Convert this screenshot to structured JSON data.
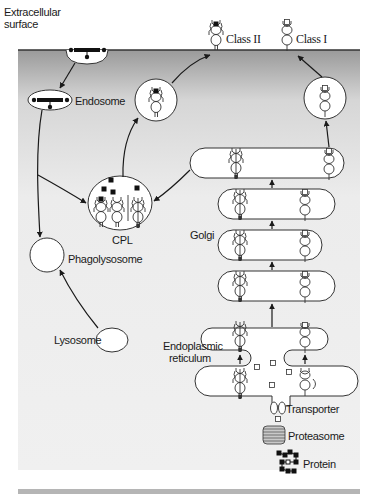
{
  "diagram": {
    "labels": {
      "extracellular": "Extracellular\nsurface",
      "extracellular_line1": "Extracellular",
      "extracellular_line2": "surface",
      "class2": "Class II",
      "class1": "Class I",
      "endosome": "Endosome",
      "cpl": "CPL",
      "golgi": "Golgi",
      "phagolysosome": "Phagolysosome",
      "lysosome": "Lysosome",
      "er_line1": "Endoplasmic",
      "er_line2": "reticulum",
      "transporter": "Transporter",
      "proteasome": "Proteasome",
      "protein": "Protein"
    },
    "colors": {
      "ink": "#1a1a1a",
      "membrane": "#333333",
      "gradient_top": "#9a9a9a",
      "gradient_bottom": "#f2f2f2",
      "organelle_fill": "#ffffff"
    },
    "nodes": [
      {
        "id": "extracellular-surface",
        "label": "Extracellular surface"
      },
      {
        "id": "endosome",
        "label": "Endosome"
      },
      {
        "id": "cpl",
        "label": "CPL"
      },
      {
        "id": "phagolysosome",
        "label": "Phagolysosome"
      },
      {
        "id": "lysosome",
        "label": "Lysosome"
      },
      {
        "id": "golgi",
        "label": "Golgi"
      },
      {
        "id": "er",
        "label": "Endoplasmic reticulum"
      },
      {
        "id": "transporter",
        "label": "Transporter"
      },
      {
        "id": "proteasome",
        "label": "Proteasome"
      },
      {
        "id": "protein",
        "label": "Protein"
      },
      {
        "id": "class2",
        "label": "Class II"
      },
      {
        "id": "class1",
        "label": "Class I"
      }
    ],
    "edges": [
      {
        "from": "extracellular-surface",
        "to": "endosome"
      },
      {
        "from": "endosome",
        "to": "cpl"
      },
      {
        "from": "endosome",
        "to": "phagolysosome"
      },
      {
        "from": "lysosome",
        "to": "phagolysosome"
      },
      {
        "from": "cpl",
        "to": "class2"
      },
      {
        "from": "golgi",
        "to": "cpl"
      },
      {
        "from": "golgi",
        "to": "class1"
      },
      {
        "from": "er",
        "to": "golgi"
      },
      {
        "from": "transporter",
        "to": "er"
      },
      {
        "from": "proteasome",
        "to": "transporter"
      },
      {
        "from": "protein",
        "to": "proteasome"
      }
    ]
  }
}
